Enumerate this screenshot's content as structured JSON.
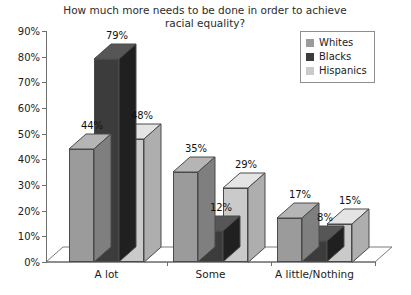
{
  "chart_data": {
    "type": "bar",
    "title": "How much more needs to be done in order to achieve\nracial equality?",
    "title_line1": "How much more needs to be done in order to achieve",
    "title_line2": "racial equality?",
    "xlabel": "",
    "ylabel": "",
    "ylim": [
      0,
      90
    ],
    "ytick_labels": [
      "90%",
      "80%",
      "70%",
      "60%",
      "50%",
      "40%",
      "30%",
      "20%",
      "10%",
      "0%"
    ],
    "ytick_values": [
      90,
      80,
      70,
      60,
      50,
      40,
      30,
      20,
      10,
      0
    ],
    "grid": false,
    "legend_position": "top-right",
    "style": "3d-clustered-column",
    "categories": [
      "A lot",
      "Some",
      "A little/Nothing"
    ],
    "series": [
      {
        "name": "Whites",
        "color": "#9b9b9b",
        "values": [
          44,
          35,
          17
        ],
        "labels": [
          "44%",
          "35%",
          "17%"
        ]
      },
      {
        "name": "Blacks",
        "color": "#3c3c3c",
        "values": [
          79,
          12,
          8
        ],
        "labels": [
          "79%",
          "12%",
          "8%"
        ]
      },
      {
        "name": "Hispanics",
        "color": "#cacaca",
        "values": [
          48,
          29,
          15
        ],
        "labels": [
          "48%",
          "29%",
          "15%"
        ]
      }
    ]
  },
  "legend": {
    "items": [
      {
        "label": "Whites",
        "color": "#9b9b9b"
      },
      {
        "label": "Blacks",
        "color": "#3c3c3c"
      },
      {
        "label": "Hispanics",
        "color": "#cacaca"
      }
    ]
  }
}
